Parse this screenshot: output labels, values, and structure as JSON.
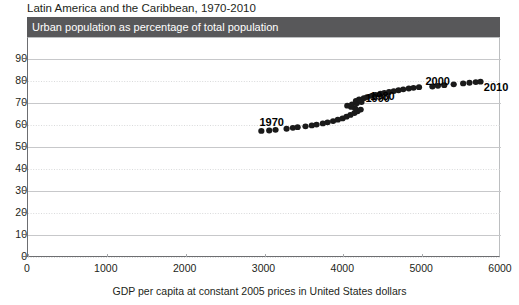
{
  "figure": {
    "title": "Latin America and the Caribbean, 1970-2010",
    "subtitle": "Urban population as percentage of total population",
    "header_color": "#58585a",
    "marker_color": "#1a1a1a"
  },
  "chart_data": {
    "type": "scatter",
    "title": "Latin America and the Caribbean, 1970-2010",
    "subtitle": "Urban population as percentage of total population",
    "xlabel": "GDP per capita at constant 2005 prices  in United States dollars",
    "ylabel": "Urban population as percentage of total population",
    "xlim": [
      0,
      6000
    ],
    "ylim": [
      0,
      90
    ],
    "xticks": [
      0,
      1000,
      2000,
      3000,
      4000,
      5000,
      6000
    ],
    "yticks": [
      0,
      10,
      20,
      30,
      40,
      50,
      60,
      70,
      80,
      90
    ],
    "xtick_labels": [
      "0",
      "1000",
      "2000",
      "3000",
      "4000",
      "5000",
      "6000"
    ],
    "ytick_labels": [
      "0",
      "10",
      "20",
      "30",
      "40",
      "50",
      "60",
      "70",
      "80",
      "90"
    ],
    "grid": "horizontal",
    "legend": "none",
    "annotations": [
      {
        "text": "1970",
        "x": 3000,
        "y": 57.3,
        "dx": -4,
        "dy": -13
      },
      {
        "text": "1980",
        "x": 4480,
        "y": 79.5,
        "dx": -10,
        "dy": 10
      },
      {
        "text": "1990",
        "x": 4230,
        "y": 70.4,
        "dx": 5,
        "dy": -8
      },
      {
        "text": "2000",
        "x": 5130,
        "y": 77.5,
        "dx": -6,
        "dy": -10
      },
      {
        "text": "2010",
        "x": 5680,
        "y": 79.6,
        "dx": 9,
        "dy": 1
      }
    ],
    "series": [
      {
        "name": "Latin America and the Caribbean",
        "x": [
          2960,
          3060,
          3140,
          3280,
          3360,
          3420,
          3520,
          3600,
          3660,
          3740,
          3800,
          3870,
          3930,
          3990,
          4040,
          4090,
          4140,
          4180,
          4220,
          4150,
          4100,
          4050,
          4110,
          4170,
          4230,
          4160,
          4200,
          4260,
          4300,
          4360,
          4410,
          4470,
          4520,
          4580,
          4640,
          4700,
          4760,
          4830,
          4890,
          4960,
          5130,
          5200,
          5280,
          5400,
          5520,
          5600,
          5680,
          5740
        ],
        "y": [
          57.3,
          57.5,
          57.8,
          58.3,
          58.7,
          59.0,
          59.4,
          59.8,
          60.2,
          60.7,
          61.2,
          61.8,
          62.4,
          63.0,
          63.8,
          64.6,
          65.4,
          66.2,
          67.0,
          67.6,
          68.2,
          68.8,
          69.4,
          69.9,
          70.4,
          71.0,
          71.6,
          72.2,
          72.7,
          73.2,
          73.7,
          74.2,
          74.6,
          75.0,
          75.4,
          75.8,
          76.2,
          76.6,
          76.9,
          77.2,
          77.5,
          77.8,
          78.1,
          78.5,
          78.9,
          79.2,
          79.5,
          79.7
        ]
      }
    ]
  }
}
